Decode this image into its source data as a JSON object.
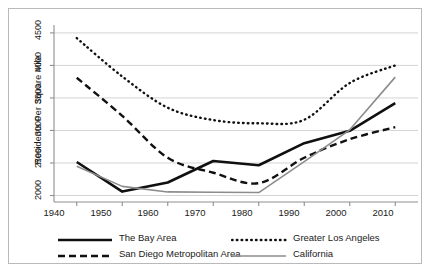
{
  "chart_data": {
    "type": "line",
    "title": "",
    "xlabel": "",
    "ylabel": "Residents Per Square Mile",
    "x": [
      1940,
      1950,
      1960,
      1970,
      1980,
      1990,
      2000,
      2010
    ],
    "xlim": [
      1935,
      2015
    ],
    "ylim": [
      1900,
      4560
    ],
    "xticks": [
      "1940",
      "1950",
      "1960",
      "1970",
      "1980",
      "1990",
      "2000",
      "2010"
    ],
    "yticks": [
      "2000",
      "2500",
      "3000",
      "3500",
      "4000",
      "4500"
    ],
    "ytick_values": [
      2000,
      2500,
      3000,
      3500,
      4000,
      4500
    ],
    "grid": "horizontal",
    "legend_position": "below",
    "series": [
      {
        "name": "The Bay Area",
        "style": "solid-thick",
        "color": "#101010",
        "values": [
          2515,
          2060,
          2200,
          2530,
          2465,
          2805,
          2995,
          3420
        ]
      },
      {
        "name": "Greater Los Angeles",
        "style": "dotted",
        "color": "#101010",
        "values": [
          4420,
          3830,
          3350,
          3160,
          3110,
          3165,
          3730,
          4000
        ]
      },
      {
        "name": "San Diego Metropolitan Area",
        "style": "dashed",
        "color": "#101010",
        "values": [
          3810,
          3225,
          2580,
          2350,
          2190,
          2580,
          2865,
          3050
        ]
      },
      {
        "name": "California",
        "style": "solid-thin",
        "color": "#8c8c8c",
        "values": [
          2450,
          2140,
          2055,
          2050,
          2045,
          2520,
          3010,
          3820
        ]
      }
    ]
  },
  "legend": {
    "entries": [
      {
        "label": "The Bay Area",
        "key": "bay-area"
      },
      {
        "label": "Greater Los Angeles",
        "key": "greater-los-angeles"
      },
      {
        "label": "San Diego Metropolitan Area",
        "key": "san-diego"
      },
      {
        "label": "California",
        "key": "california"
      }
    ]
  },
  "axis": {
    "y_title": "Residents Per Square Mile"
  },
  "colors": {
    "series_black": "#101010",
    "series_gray": "#8c8c8c",
    "gridline": "#cfcfcf",
    "axis": "#8f8f8f",
    "frame": "#b9b9b9",
    "text": "#1a1a1a",
    "background": "#ffffff"
  }
}
